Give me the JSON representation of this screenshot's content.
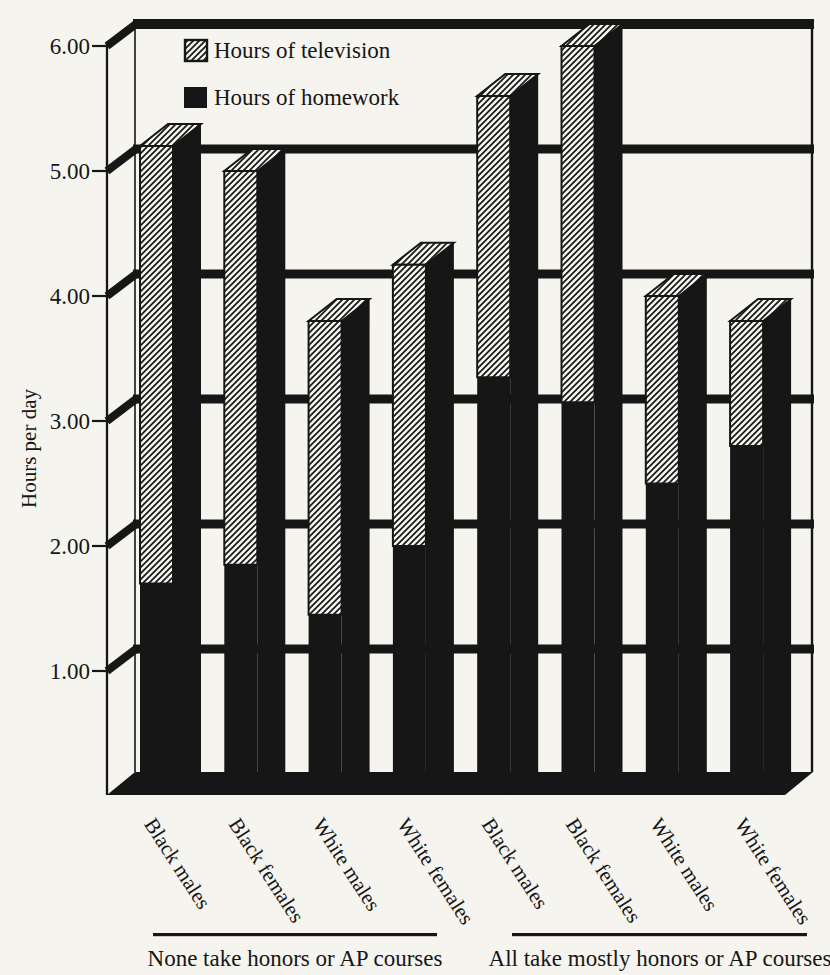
{
  "page": {
    "paper_color": "#f5f4ef",
    "ink_color": "#161616"
  },
  "chart_data": {
    "type": "bar",
    "stacked": true,
    "effect": "pseudo-3d",
    "title": "",
    "ylabel": "Hours per day",
    "xlabel": "",
    "ylim": [
      0,
      6.25
    ],
    "yticks": [
      1,
      2,
      3,
      4,
      5,
      6
    ],
    "ytick_labels": [
      "1.00",
      "2.00",
      "3.00",
      "4.00",
      "5.00",
      "6.00"
    ],
    "grid": "horizontal-heavy-black",
    "categories": [
      "Black males",
      "Black females",
      "White males",
      "White females",
      "Black males",
      "Black females",
      "White males",
      "White females"
    ],
    "series": [
      {
        "name": "Hours of homework",
        "swatch": "solid-black",
        "values": [
          1.7,
          1.85,
          1.45,
          2.0,
          3.35,
          3.15,
          2.5,
          2.8
        ]
      },
      {
        "name": "Hours of television",
        "swatch": "diagonal-hatch",
        "values": [
          3.5,
          3.15,
          2.35,
          2.25,
          2.25,
          2.85,
          1.5,
          1.0
        ]
      }
    ],
    "bar_totals": [
      5.2,
      5.0,
      3.8,
      4.25,
      5.6,
      6.0,
      4.0,
      3.8
    ],
    "legend": {
      "position": "top-left-inside",
      "items": [
        "Hours of television",
        "Hours of homework"
      ]
    },
    "groups": [
      {
        "label": "None take honors or AP courses",
        "category_indexes": [
          0,
          1,
          2,
          3
        ]
      },
      {
        "label": "All take mostly honors or AP courses",
        "category_indexes": [
          4,
          5,
          6,
          7
        ]
      }
    ]
  }
}
